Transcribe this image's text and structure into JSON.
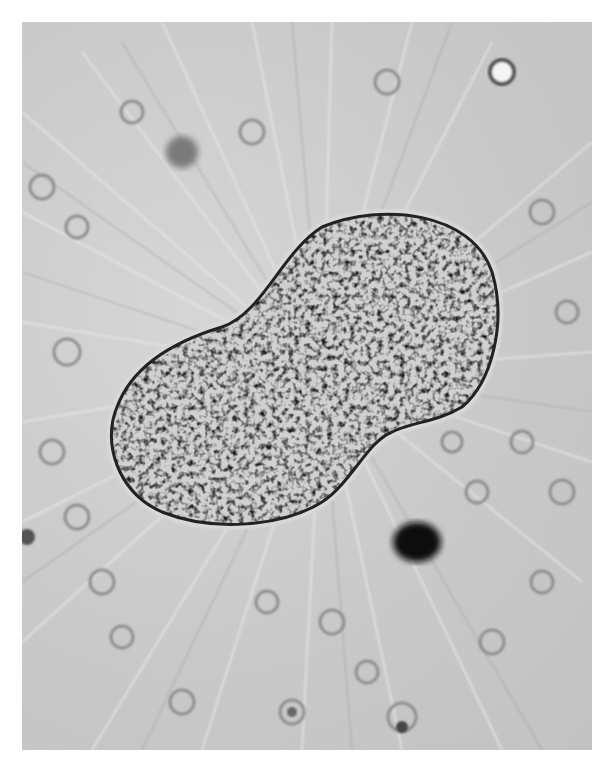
{
  "image": {
    "description": "Grayscale light micrograph of a granular, bilobed cell body with many radiating fine filaments (pseudopodia) against a field of small round cells",
    "colors": {
      "background": "#ffffff",
      "field": "#cfcfcf",
      "cell_body_dark": "#2a2a2a",
      "cell_body_light": "#e8e8e8",
      "dark_particle": "#111111"
    }
  }
}
